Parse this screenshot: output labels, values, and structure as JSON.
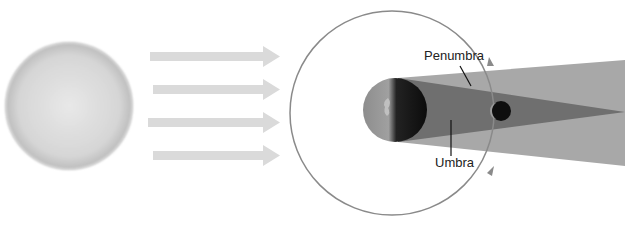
{
  "diagram": {
    "type": "lunar-eclipse",
    "labels": {
      "penumbra": "Penumbra",
      "umbra": "Umbra"
    },
    "colors": {
      "sun": "#d4d4d4",
      "arrows": "#dcdcdc",
      "orbit": "#8a8a8a",
      "penumbra": "#a9a9a9",
      "umbra": "#6e6e6e",
      "earth_dark": "#111111",
      "earth_lit": "#8c8c8c"
    },
    "elements": [
      "sun",
      "sunlight-arrows",
      "moon-orbit",
      "earth",
      "penumbra",
      "umbra",
      "moon"
    ]
  }
}
